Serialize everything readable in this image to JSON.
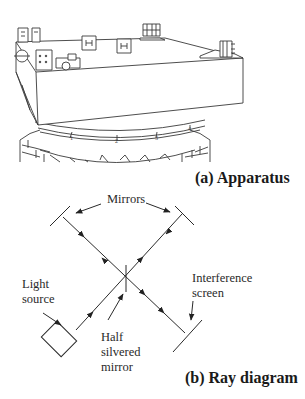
{
  "figure": {
    "panel_a": {
      "caption": "(a) Apparatus",
      "scale_marks": [
        "1",
        "2",
        "3",
        "4"
      ]
    },
    "panel_b": {
      "caption": "(b) Ray diagram",
      "labels": {
        "mirrors": "Mirrors",
        "light_source_line1": "Light",
        "light_source_line2": "source",
        "half_mirror_line1": "Half",
        "half_mirror_line2": "silvered",
        "half_mirror_line3": "mirror",
        "screen_line1": "Interference",
        "screen_line2": "screen"
      }
    }
  }
}
